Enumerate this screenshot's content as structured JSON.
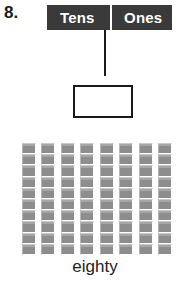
{
  "worksheet": {
    "problem_number": "8.",
    "word_label": "eighty",
    "colors": {
      "header_background": "#3a3a3a",
      "header_text": "#ffffff",
      "ink": "#1a1a1a",
      "block_fill": "#8d8d8d",
      "page_background": "#ffffff"
    }
  },
  "place_value_header": {
    "tens_label": "Tens",
    "ones_label": "Ones"
  },
  "answer_box": {
    "value": "",
    "placeholder": ""
  },
  "chart_data": {
    "type": "bar",
    "title": "",
    "subtitle": "",
    "xlabel": "",
    "ylabel": "",
    "categories": [
      "1",
      "2",
      "3",
      "4",
      "5",
      "6",
      "7",
      "8"
    ],
    "values": [
      10,
      10,
      10,
      10,
      10,
      10,
      10,
      10
    ],
    "ylim": [
      0,
      10
    ],
    "grid": false,
    "legend": "none",
    "annotations": [
      "eighty"
    ],
    "rod_count": 8,
    "cubes_per_rod": 10,
    "total": 80
  }
}
